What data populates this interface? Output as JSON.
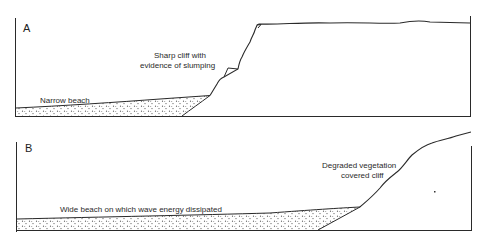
{
  "figure": {
    "panels": [
      {
        "id": "A",
        "letter": "A",
        "labels": {
          "cliff_line1": "Sharp cliff with",
          "cliff_line2": "evidence of slumping",
          "beach": "Narrow beach"
        }
      },
      {
        "id": "B",
        "letter": "B",
        "labels": {
          "cliff_line1": "Degraded vegetation",
          "cliff_line2": "covered cliff",
          "beach": "Wide beach on which wave energy dissipated"
        }
      }
    ],
    "colors": {
      "line": "#2a2a2a",
      "stipple": "#555555",
      "background": "#ffffff"
    }
  }
}
